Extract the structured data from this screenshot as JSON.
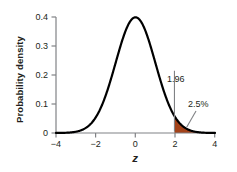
{
  "chart_data": {
    "type": "line",
    "title": "",
    "subtitle": "",
    "xlabel": "z",
    "ylabel": "Probability density",
    "xlim": [
      -4,
      4
    ],
    "ylim": [
      0,
      0.42
    ],
    "grid": false,
    "legend": null,
    "xticks": [
      "−4",
      "−2",
      "0",
      "2",
      "4"
    ],
    "xtick_values": [
      -4,
      -2,
      0,
      2,
      4
    ],
    "yticks": [
      "0",
      "0.1",
      "0.2",
      "0.3",
      "0.4"
    ],
    "ytick_values": [
      0,
      0.1,
      0.2,
      0.3,
      0.4
    ],
    "series": [
      {
        "name": "Standard normal density",
        "color": "#000000",
        "x": [
          -4,
          -3.8,
          -3.6,
          -3.4,
          -3.2,
          -3,
          -2.8,
          -2.6,
          -2.4,
          -2.2,
          -2,
          -1.8,
          -1.6,
          -1.4,
          -1.2,
          -1,
          -0.8,
          -0.6,
          -0.4,
          -0.2,
          0,
          0.2,
          0.4,
          0.6,
          0.8,
          1,
          1.2,
          1.4,
          1.6,
          1.8,
          2,
          2.2,
          2.4,
          2.6,
          2.8,
          3,
          3.2,
          3.4,
          3.6,
          3.8,
          4
        ],
        "y": [
          0.0001,
          0.0003,
          0.0006,
          0.0012,
          0.0024,
          0.0044,
          0.0079,
          0.0136,
          0.0224,
          0.0355,
          0.054,
          0.079,
          0.1109,
          0.1497,
          0.1942,
          0.242,
          0.2897,
          0.3332,
          0.3683,
          0.391,
          0.3989,
          0.391,
          0.3683,
          0.3332,
          0.2897,
          0.242,
          0.1942,
          0.1497,
          0.1109,
          0.079,
          0.054,
          0.0355,
          0.0224,
          0.0136,
          0.0079,
          0.0044,
          0.0024,
          0.0012,
          0.0006,
          0.0003,
          0.0001
        ]
      }
    ],
    "shaded_region": {
      "label": "2.5%",
      "from": 1.96,
      "to": 4,
      "fill_color": "#A4431A",
      "area_fraction": 0.025
    },
    "annotations": [
      {
        "name": "critical-value",
        "text": "1.96",
        "x": 1.96,
        "y": 0.215
      },
      {
        "name": "tail-area",
        "text": "2.5%",
        "x": 2.62,
        "y": 0.1
      }
    ]
  },
  "axis": {
    "y_label": "Probability density",
    "x_label": "z",
    "y_ticks": [
      "0.4",
      "0.3",
      "0.2",
      "0.1",
      "0"
    ],
    "x_ticks": [
      "−4",
      "−2",
      "0",
      "2",
      "4"
    ]
  },
  "annotations": {
    "critical_value": "1.96",
    "tail_percent": "2.5%"
  },
  "colors": {
    "curve": "#000000",
    "shade": "#A4431A",
    "axis": "#808285",
    "text": "#231f20"
  }
}
